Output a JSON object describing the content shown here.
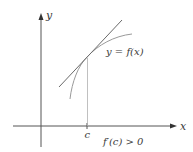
{
  "diagram": {
    "axes": {
      "x_label": "x",
      "y_label": "y"
    },
    "curve_label": "y = f(x)",
    "point_label": "c",
    "condition_label": "f′(c) > 0",
    "colors": {
      "axis": "#555555",
      "tangent": "#6a6a6a",
      "curve": "#9a9a9a",
      "guide": "#b0b0b0",
      "text": "#3a3a3a"
    }
  }
}
